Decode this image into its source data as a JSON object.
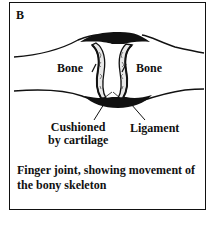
{
  "figure": {
    "panel_letter": "B",
    "labels": {
      "bone_left": "Bone",
      "bone_right": "Bone",
      "cushioned_line1": "Cushioned",
      "cushioned_line2": "by cartilage",
      "ligament": "Ligament"
    },
    "caption": "Finger joint, showing movement of the bony skeleton",
    "colors": {
      "ink": "#111111",
      "background": "#ffffff",
      "cartilage_fill": "#e8e8e8"
    }
  }
}
